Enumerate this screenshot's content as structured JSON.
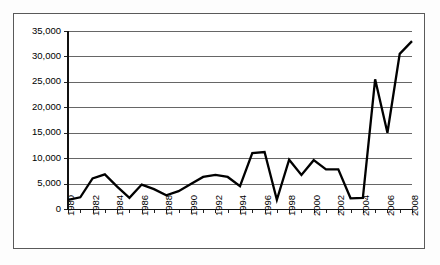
{
  "chart_data": {
    "type": "line",
    "title": "",
    "subtitle": "",
    "xlabel": "",
    "ylabel": "",
    "x": [
      1980,
      1981,
      1982,
      1983,
      1984,
      1985,
      1986,
      1987,
      1988,
      1989,
      1990,
      1991,
      1992,
      1993,
      1994,
      1995,
      1996,
      1997,
      1998,
      1999,
      2000,
      2001,
      2002,
      2003,
      2004,
      2005,
      2006,
      2007,
      2008
    ],
    "values": [
      1800,
      2300,
      6000,
      6800,
      4400,
      2200,
      4800,
      3900,
      2700,
      3500,
      4900,
      6300,
      6700,
      6300,
      4500,
      11000,
      11200,
      1800,
      9700,
      6700,
      9600,
      7800,
      7800,
      2100,
      2200,
      25500,
      15000,
      30500,
      33000
    ],
    "series": [
      {
        "name": "series-1",
        "values": [
          1800,
          2300,
          6000,
          6800,
          4400,
          2200,
          4800,
          3900,
          2700,
          3500,
          4900,
          6300,
          6700,
          6300,
          4500,
          11000,
          11200,
          1800,
          9700,
          6700,
          9600,
          7800,
          7800,
          2100,
          2200,
          25500,
          15000,
          30500,
          33000
        ]
      }
    ],
    "xlim": [
      1980,
      2008
    ],
    "ylim": [
      0,
      35000
    ],
    "ytick_values": [
      0,
      5000,
      10000,
      15000,
      20000,
      25000,
      30000,
      35000
    ],
    "ytick_labels": [
      "0",
      "5,000",
      "10,000",
      "15,000",
      "20,000",
      "25,000",
      "30,000",
      "35,000"
    ],
    "xtick_values": [
      1980,
      1982,
      1984,
      1986,
      1988,
      1990,
      1992,
      1994,
      1996,
      1998,
      2000,
      2002,
      2004,
      2006,
      2008
    ],
    "xtick_labels": [
      "1980",
      "1982",
      "1984",
      "1986",
      "1988",
      "1990",
      "1992",
      "1994",
      "1996",
      "1998",
      "2000",
      "2002",
      "2004",
      "2006",
      "2008"
    ],
    "xtick_rotation": -90,
    "grid": true,
    "grid_axis": "y",
    "legend": false,
    "legend_position": "none",
    "annotations": [],
    "colors": {
      "line": "#000000",
      "grid": "#666666",
      "axis": "#111111",
      "frame": "#5a5a5a",
      "background": "#ffffff"
    }
  }
}
